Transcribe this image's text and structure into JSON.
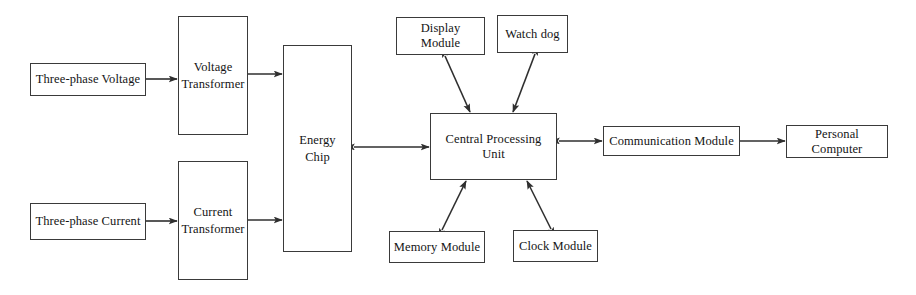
{
  "diagram": {
    "background_color": "#ffffff",
    "line_color": "#2f2f2f",
    "box_border_color": "#3a3a3a",
    "text_color": "#141414",
    "nodes": [
      {
        "id": "three_phase_voltage",
        "label": "Three-phase Voltage",
        "x": 30,
        "y": 63,
        "w": 116,
        "h": 33
      },
      {
        "id": "voltage_transformer",
        "label": "Voltage\nTransformer",
        "x": 178,
        "y": 16,
        "w": 70,
        "h": 119
      },
      {
        "id": "three_phase_current",
        "label": "Three-phase Current",
        "x": 30,
        "y": 203,
        "w": 116,
        "h": 37
      },
      {
        "id": "current_transformer",
        "label": "Current\nTransformer",
        "x": 178,
        "y": 161,
        "w": 70,
        "h": 119
      },
      {
        "id": "energy_chip",
        "label": "Energy\nChip",
        "x": 283,
        "y": 45,
        "w": 69,
        "h": 207
      },
      {
        "id": "display_module",
        "label": "Display Module",
        "x": 396,
        "y": 17,
        "w": 89,
        "h": 38
      },
      {
        "id": "watch_dog",
        "label": "Watch dog",
        "x": 497,
        "y": 15,
        "w": 71,
        "h": 38
      },
      {
        "id": "central_processing_unit",
        "label": "Central Processing Unit",
        "x": 430,
        "y": 113,
        "w": 127,
        "h": 67
      },
      {
        "id": "memory_module",
        "label": "Memory Module",
        "x": 389,
        "y": 231,
        "w": 96,
        "h": 32
      },
      {
        "id": "clock_module",
        "label": "Clock Module",
        "x": 513,
        "y": 230,
        "w": 85,
        "h": 32
      },
      {
        "id": "communication_module",
        "label": "Communication Module",
        "x": 603,
        "y": 126,
        "w": 137,
        "h": 30
      },
      {
        "id": "personal_computer",
        "label": "Personal Computer",
        "x": 786,
        "y": 125,
        "w": 102,
        "h": 33
      }
    ],
    "connections": [
      {
        "id": "voltage_to_vt",
        "from": "three_phase_voltage",
        "to": "voltage_transformer",
        "direction": "one-way",
        "kind": "horizontal"
      },
      {
        "id": "vt_to_chip",
        "from": "voltage_transformer",
        "to": "energy_chip",
        "direction": "one-way",
        "kind": "horizontal"
      },
      {
        "id": "current_to_ct",
        "from": "three_phase_current",
        "to": "current_transformer",
        "direction": "one-way",
        "kind": "horizontal"
      },
      {
        "id": "ct_to_chip",
        "from": "current_transformer",
        "to": "energy_chip",
        "direction": "one-way",
        "kind": "horizontal"
      },
      {
        "id": "chip_to_cpu",
        "from": "energy_chip",
        "to": "central_processing_unit",
        "direction": "two-way",
        "kind": "horizontal"
      },
      {
        "id": "cpu_to_display",
        "from": "central_processing_unit",
        "to": "display_module",
        "direction": "two-way",
        "kind": "diagonal"
      },
      {
        "id": "cpu_to_watchdog",
        "from": "central_processing_unit",
        "to": "watch_dog",
        "direction": "two-way",
        "kind": "diagonal"
      },
      {
        "id": "cpu_to_memory",
        "from": "central_processing_unit",
        "to": "memory_module",
        "direction": "two-way",
        "kind": "diagonal"
      },
      {
        "id": "cpu_to_clock",
        "from": "central_processing_unit",
        "to": "clock_module",
        "direction": "two-way",
        "kind": "diagonal"
      },
      {
        "id": "cpu_to_comm",
        "from": "central_processing_unit",
        "to": "communication_module",
        "direction": "two-way",
        "kind": "horizontal"
      },
      {
        "id": "comm_to_pc",
        "from": "communication_module",
        "to": "personal_computer",
        "direction": "one-way",
        "kind": "horizontal"
      }
    ]
  }
}
